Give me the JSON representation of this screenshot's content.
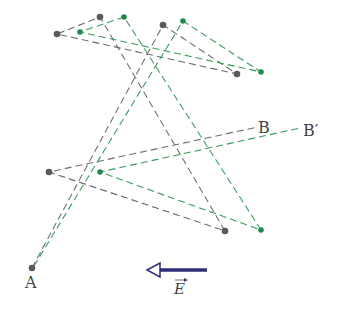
{
  "diagram": {
    "labels": {
      "start": "A",
      "end_original": "B",
      "end_shifted": "B′",
      "field": "E"
    },
    "colors": {
      "original_path": "#6e6e6e",
      "shifted_path": "#3a9a5c",
      "original_point": "#5a5a5a",
      "shifted_point": "#1f8a4c",
      "field_arrow": "#2e2e7a"
    },
    "original_path": [
      [
        32,
        268
      ],
      [
        163,
        25
      ],
      [
        237,
        74
      ],
      [
        57,
        34
      ],
      [
        100,
        17
      ],
      [
        225,
        231
      ],
      [
        49,
        172
      ],
      [
        258,
        127
      ]
    ],
    "shifted_path": [
      [
        34,
        266
      ],
      [
        183,
        21
      ],
      [
        261,
        72
      ],
      [
        80,
        32
      ],
      [
        124,
        17
      ],
      [
        261,
        230
      ],
      [
        100,
        172
      ],
      [
        300,
        128
      ]
    ],
    "original_points": [
      [
        32,
        268
      ],
      [
        163,
        25
      ],
      [
        237,
        74
      ],
      [
        57,
        34
      ],
      [
        100,
        17
      ],
      [
        225,
        231
      ],
      [
        49,
        172
      ]
    ],
    "shifted_points": [
      [
        183,
        21
      ],
      [
        261,
        72
      ],
      [
        80,
        32
      ],
      [
        124,
        17
      ],
      [
        261,
        230
      ],
      [
        100,
        172
      ]
    ],
    "field_arrow": {
      "from": [
        207,
        270
      ],
      "to": [
        148,
        270
      ],
      "direction": "left"
    }
  }
}
